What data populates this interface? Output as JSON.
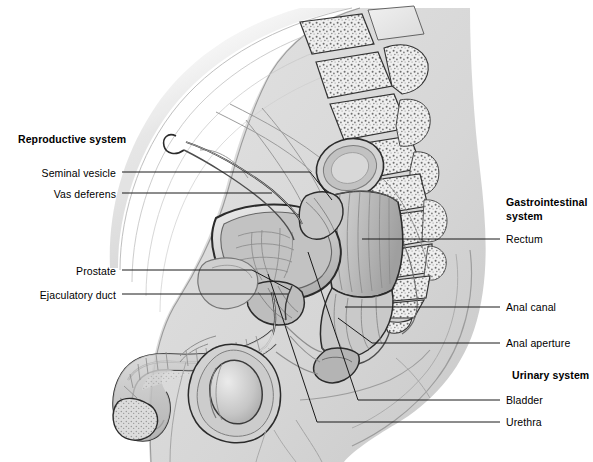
{
  "figure": {
    "title_alt": "Sagittal section of the male pelvis",
    "width": 593,
    "height": 462,
    "background_color": "#ffffff",
    "line_color": "#1a1a1a",
    "body_fill": "#d9d9d9"
  },
  "headings": {
    "reproductive": "Reproductive system",
    "gastrointestinal_line1": "Gastrointestinal",
    "gastrointestinal_line2": "system",
    "urinary": "Urinary system"
  },
  "labels_left": [
    {
      "id": "seminal-vesicle",
      "text": "Seminal vesicle",
      "x": 45,
      "y": 167,
      "line_x1": 122,
      "line_y1": 172,
      "line_x2": 310,
      "line_y2": 172,
      "elbow_x": 330,
      "elbow_y": 198
    },
    {
      "id": "vas-deferens",
      "text": "Vas deferens",
      "x": 58,
      "y": 188,
      "line_x1": 122,
      "line_y1": 193,
      "line_x2": 270,
      "line_y2": 193,
      "elbow_x": 0,
      "elbow_y": 0
    },
    {
      "id": "prostate",
      "text": "Prostate",
      "x": 76,
      "y": 265,
      "line_x1": 122,
      "line_y1": 270,
      "line_x2": 252,
      "line_y2": 270,
      "elbow_x": 288,
      "elbow_y": 289
    },
    {
      "id": "ejaculatory-duct",
      "text": "Ejaculatory duct",
      "x": 42,
      "y": 289,
      "line_x1": 122,
      "line_y1": 294,
      "line_x2": 285,
      "line_y2": 294,
      "elbow_x": 0,
      "elbow_y": 0
    }
  ],
  "labels_right": [
    {
      "id": "rectum",
      "text": "Rectum",
      "x": 506,
      "y": 234,
      "line_x1": 500,
      "line_y1": 239,
      "line_x2": 362,
      "line_y2": 239
    },
    {
      "id": "anal-canal",
      "text": "Anal canal",
      "x": 506,
      "y": 302,
      "line_x1": 500,
      "line_y1": 307,
      "line_x2": 345,
      "line_y2": 307
    },
    {
      "id": "anal-aperture",
      "text": "Anal aperture",
      "x": 506,
      "y": 338,
      "line_x1": 500,
      "line_y1": 343,
      "line_x2": 372,
      "line_y2": 343,
      "elbow_x": 338,
      "elbow_y": 318
    },
    {
      "id": "bladder",
      "text": "Bladder",
      "x": 506,
      "y": 395,
      "line_x1": 500,
      "line_y1": 400,
      "line_x2": 358,
      "line_y2": 400,
      "elbow_x": 308,
      "elbow_y": 252
    },
    {
      "id": "urethra",
      "text": "Urethra",
      "x": 506,
      "y": 417,
      "line_x1": 500,
      "line_y1": 422,
      "line_x2": 317,
      "line_y2": 422,
      "elbow_x": 268,
      "elbow_y": 274
    }
  ],
  "heading_positions": {
    "reproductive": {
      "x": 18,
      "y": 133
    },
    "gastrointestinal": {
      "x": 506,
      "y": 196
    },
    "urinary": {
      "x": 512,
      "y": 370
    }
  },
  "anatomy_parts": [
    "anterior-abdominal-wall",
    "lumbar-vertebrae",
    "sacrum",
    "coccyx",
    "urinary-bladder",
    "prostate-gland",
    "seminal-vesicle",
    "vas-deferens",
    "ejaculatory-duct",
    "rectum",
    "anal-canal",
    "anal-sphincter",
    "penis-shaft",
    "glans-penis",
    "corpus-spongiosum",
    "scrotum",
    "testis",
    "pubic-symphysis",
    "urethra",
    "buttock-contour",
    "thigh-contour"
  ]
}
